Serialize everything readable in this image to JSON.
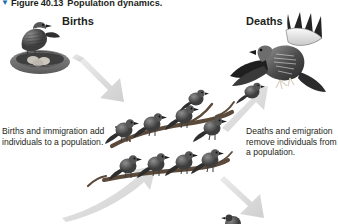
{
  "figure": {
    "caret": "▼",
    "number": "Figure 40.13",
    "title": "Population dynamics.",
    "background_color": "#ffffff",
    "text_color": "#231f20",
    "caret_color": "#1b6ca8",
    "arrow_color": "#d9d9d9",
    "art_color": "#4a4a4a"
  },
  "headings": {
    "births": "Births",
    "deaths": "Deaths"
  },
  "captions": {
    "births": "Births and immigration add individuals to a population.",
    "deaths": "Deaths and emigration remove individuals from a population."
  },
  "illustrations": [
    {
      "name": "bird-on-nest",
      "label": "Bird perched on a nest with eggs",
      "side": "left"
    },
    {
      "name": "hawk-in-flight",
      "label": "Hawk with spread wings in flight",
      "side": "right"
    },
    {
      "name": "sparrow-flock-on-branch",
      "label": "Flock of sparrows perched on branches",
      "side": "center"
    },
    {
      "name": "sparrow-partial-bottom",
      "label": "Partially visible sparrow at bottom edge",
      "side": "bottom-right"
    }
  ],
  "arrows": [
    {
      "name": "arrow-births-in",
      "direction": "down-right",
      "from": "births",
      "to": "population"
    },
    {
      "name": "arrow-deaths-out",
      "direction": "up-right",
      "from": "population",
      "to": "deaths"
    },
    {
      "name": "arrow-immigration-in",
      "direction": "up-right",
      "from": "immigration",
      "to": "population"
    },
    {
      "name": "arrow-emigration-out",
      "direction": "down-right",
      "from": "population",
      "to": "emigration"
    }
  ]
}
